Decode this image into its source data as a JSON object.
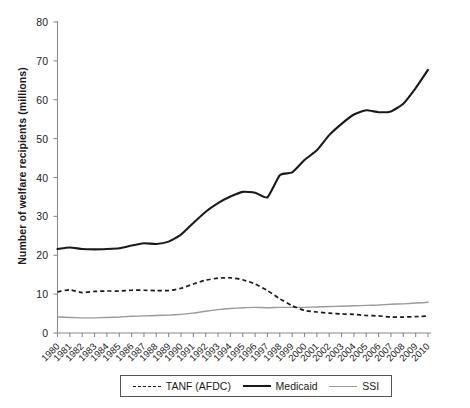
{
  "chart_data": {
    "type": "line",
    "title": "",
    "xlabel": "",
    "ylabel": "Number of welfare recipients (millions)",
    "ylim": [
      0,
      80
    ],
    "yticks": [
      0,
      10,
      20,
      30,
      40,
      50,
      60,
      70,
      80
    ],
    "grid": false,
    "legend_position": "bottom",
    "x": [
      1980,
      1981,
      1982,
      1983,
      1984,
      1985,
      1986,
      1987,
      1988,
      1989,
      1990,
      1991,
      1992,
      1993,
      1994,
      1995,
      1996,
      1997,
      1998,
      1999,
      2000,
      2001,
      2002,
      2003,
      2004,
      2005,
      2006,
      2007,
      2008,
      2009,
      2010
    ],
    "categories": [
      "1980",
      "1981",
      "1982",
      "1983",
      "1984",
      "1985",
      "1986",
      "1987",
      "1988",
      "1989",
      "1990",
      "1991",
      "1992",
      "1993",
      "1994",
      "1995",
      "1996",
      "1997",
      "1998",
      "1999",
      "2000",
      "2001",
      "2002",
      "2003",
      "2004",
      "2005",
      "2006",
      "2007",
      "2008",
      "2009",
      "2010"
    ],
    "series": [
      {
        "name": "TANF (AFDC)",
        "style": "dashed",
        "color": "#1a1a1a",
        "values": [
          10.6,
          11.1,
          10.4,
          10.7,
          10.8,
          10.8,
          11.0,
          11.0,
          10.9,
          10.9,
          11.5,
          12.6,
          13.6,
          14.1,
          14.2,
          13.7,
          12.6,
          10.9,
          8.8,
          7.0,
          5.8,
          5.4,
          5.1,
          4.9,
          4.8,
          4.5,
          4.4,
          4.1,
          4.1,
          4.2,
          4.4
        ]
      },
      {
        "name": "Medicaid",
        "style": "solid",
        "color": "#1a1a1a",
        "values": [
          21.6,
          22.0,
          21.6,
          21.5,
          21.6,
          21.8,
          22.5,
          23.1,
          22.9,
          23.5,
          25.3,
          28.3,
          31.2,
          33.4,
          35.1,
          36.3,
          36.1,
          34.9,
          40.6,
          41.3,
          44.5,
          47.0,
          50.9,
          53.8,
          56.2,
          57.3,
          56.8,
          57.0,
          59.0,
          63.0,
          67.7
        ]
      },
      {
        "name": "SSI",
        "style": "solid-thin",
        "color": "#9a9a9a",
        "values": [
          4.1,
          4.0,
          3.9,
          3.9,
          4.0,
          4.1,
          4.3,
          4.4,
          4.5,
          4.6,
          4.8,
          5.1,
          5.6,
          6.0,
          6.3,
          6.5,
          6.6,
          6.5,
          6.6,
          6.6,
          6.6,
          6.7,
          6.8,
          6.9,
          7.0,
          7.1,
          7.2,
          7.4,
          7.5,
          7.7,
          7.9
        ]
      }
    ]
  },
  "legend": {
    "entries": [
      {
        "label": "TANF (AFDC)",
        "swatch": "dashed-line-swatch"
      },
      {
        "label": "Medicaid",
        "swatch": "thick-line-swatch"
      },
      {
        "label": "SSI",
        "swatch": "gray-line-swatch"
      }
    ]
  },
  "axis": {
    "y_title": "Number of welfare recipients (millions)"
  }
}
